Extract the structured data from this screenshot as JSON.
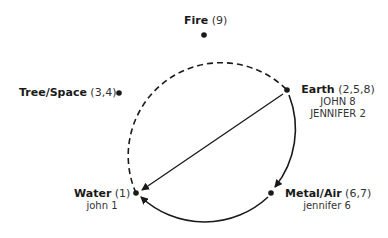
{
  "diagram": {
    "type": "five-element cycle",
    "nodes": [
      {
        "id": "fire",
        "name": "Fire",
        "numbers": "(9)",
        "people": []
      },
      {
        "id": "tree",
        "name": "Tree/Space",
        "numbers": "(3,4)",
        "people": []
      },
      {
        "id": "earth",
        "name": "Earth",
        "numbers": "(2,5,8)",
        "people": [
          "JOHN 8",
          "JENNIFER 2"
        ]
      },
      {
        "id": "water",
        "name": "Water",
        "numbers": "(1)",
        "people": [
          "john 1"
        ]
      },
      {
        "id": "metal",
        "name": "Metal/Air",
        "numbers": "(6,7)",
        "people": [
          "jennifer 6"
        ]
      }
    ],
    "edges": [
      {
        "from": "earth",
        "to": "water",
        "style": "solid-straight-arrow"
      },
      {
        "from": "earth",
        "to": "metal",
        "style": "solid-arc-arrow"
      },
      {
        "from": "metal",
        "to": "water",
        "style": "solid-arc-arrow"
      },
      {
        "from": "water",
        "to": "tree",
        "style": "dashed-arc"
      },
      {
        "from": "tree",
        "to": "fire",
        "style": "dashed-arc"
      },
      {
        "from": "fire",
        "to": "earth",
        "style": "dashed-arc"
      }
    ]
  }
}
